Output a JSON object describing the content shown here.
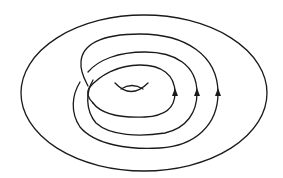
{
  "diagram": {
    "type": "torus-curve",
    "stroke_color": "#1a1a1a",
    "background": "#ffffff",
    "winding_count": 3,
    "arrows": [
      {
        "x": 175,
        "y": 93,
        "direction": "up"
      },
      {
        "x": 197,
        "y": 93,
        "direction": "up"
      },
      {
        "x": 218,
        "y": 93,
        "direction": "up"
      }
    ]
  }
}
